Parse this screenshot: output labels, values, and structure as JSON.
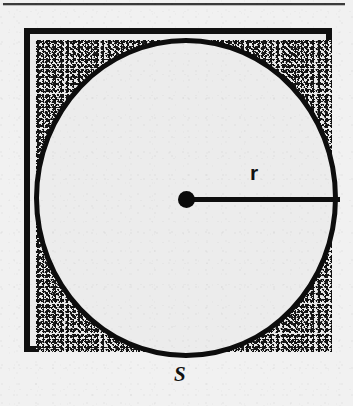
{
  "page": {
    "background_color": "#f1f1f1",
    "top_rule_color": "#3b3b3b"
  },
  "figure": {
    "title": "",
    "ink_color": "#0d0d0d",
    "fill_color": "#ececec",
    "stipple_color": "#111111",
    "square": {
      "name": "square",
      "side_label": "S"
    },
    "circle": {
      "name": "inscribed-circle",
      "radius_label": "r"
    },
    "center_point": {
      "name": "center-point"
    },
    "labels": {
      "radius": "r",
      "side": "S"
    }
  },
  "chart_data": {
    "type": "diagram",
    "shapes": [
      {
        "shape": "square",
        "label": "S",
        "label_position": "bottom-center",
        "side_px": 308,
        "x": 24,
        "y": 28,
        "stroke_px": 6,
        "stroke_color": "#101010",
        "fill_color": "#ececec"
      },
      {
        "shape": "circle",
        "label": "r",
        "label_position": "above-radius-right",
        "center_x": 178,
        "center_y": 192,
        "radius_px": 152,
        "stroke_px": 5,
        "stroke_color": "#0d0d0d",
        "fill_color": "#ececec"
      },
      {
        "shape": "point",
        "name": "center",
        "center_x": 178,
        "center_y": 192,
        "radius_px": 8,
        "fill_color": "#0a0a0a"
      },
      {
        "shape": "segment",
        "name": "radius",
        "label": "r",
        "x1": 178,
        "y1": 192,
        "x2": 332,
        "y2": 192,
        "stroke_px": 5,
        "stroke_color": "#0d0d0d"
      },
      {
        "shape": "shaded-region",
        "name": "corner-regions",
        "count": 4,
        "pattern": "stipple",
        "description": "area inside the square but outside the circle"
      }
    ],
    "relations": [
      "S = 2r",
      "circle is inscribed in square"
    ],
    "annotations": [
      "r",
      "S"
    ],
    "grid": false,
    "legend": null
  }
}
